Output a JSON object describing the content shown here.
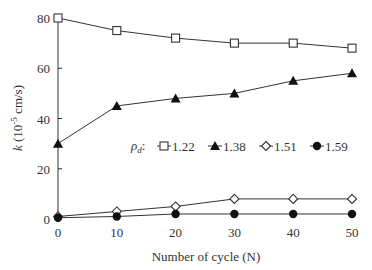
{
  "chart_data": {
    "type": "line",
    "title": "",
    "xlabel": "Number of cycle (N)",
    "ylabel": "k (10-5 cm/s)",
    "ylabel_parts": {
      "var": "k",
      "pre": " (10",
      "sup": "-5",
      "post": " cm/s)"
    },
    "x": [
      0,
      10,
      20,
      30,
      40,
      50
    ],
    "x_ticks": [
      "0",
      "10",
      "20",
      "30",
      "40",
      "50"
    ],
    "y_ticks": [
      "0",
      "20",
      "40",
      "60",
      "80"
    ],
    "xlim": [
      0,
      50
    ],
    "ylim": [
      0,
      80
    ],
    "grid": false,
    "legend_title": "ρd:",
    "legend_position": "inside-center",
    "series": [
      {
        "name": "1.22",
        "marker": "open-square",
        "values": [
          80,
          75,
          72,
          70,
          70,
          68
        ]
      },
      {
        "name": "1.38",
        "marker": "filled-triangle",
        "values": [
          30,
          45,
          48,
          50,
          55,
          58
        ]
      },
      {
        "name": "1.51",
        "marker": "open-diamond",
        "values": [
          1,
          3,
          5,
          8,
          8,
          8
        ]
      },
      {
        "name": "1.59",
        "marker": "filled-circle",
        "values": [
          0.5,
          1,
          2,
          2,
          2,
          2
        ]
      }
    ]
  }
}
